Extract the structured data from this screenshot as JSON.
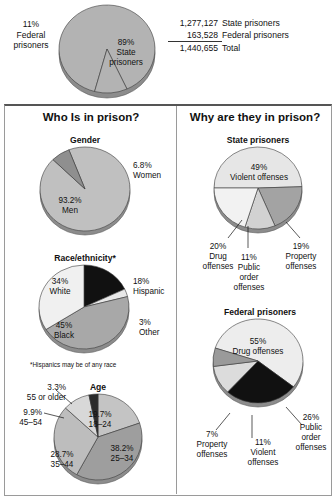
{
  "top": {
    "chart_title": "",
    "labels": {
      "federal": "11%\nFederal\nprisoners",
      "federal_pct": "11%",
      "federal_l1": "Federal",
      "federal_l2": "prisoners",
      "state_pct": "89%",
      "state_l1": "State",
      "state_l2": "prisoners"
    },
    "totals": [
      {
        "number": "1,277,127",
        "label": "State prisoners"
      },
      {
        "number": "163,528",
        "label": "Federal prisoners"
      },
      {
        "number": "1,440,655",
        "label": "Total"
      }
    ]
  },
  "panels": {
    "left_title": "Who Is in prison?",
    "right_title": "Why are they in prison?"
  },
  "footnote": "*Hispanics may be of any race",
  "chart_data": [
    {
      "id": "jurisdiction",
      "type": "pie",
      "title": "",
      "categories": [
        "State prisoners",
        "Federal prisoners"
      ],
      "values": [
        89,
        11
      ],
      "labels": [
        "89%\nState\nprisoners",
        "11%\nFederal\nprisoners"
      ],
      "colors": [
        "#b3b3b3",
        "#b3b3b3"
      ],
      "start_angle": 195,
      "total": 100
    },
    {
      "id": "gender",
      "type": "pie",
      "title": "Gender",
      "categories": [
        "Men",
        "Women"
      ],
      "values": [
        93.2,
        6.8
      ],
      "labels": [
        "93.2%\nMen",
        "6.8%\nWomen"
      ],
      "colors": [
        "#c0c0c0",
        "#8f8f8f"
      ],
      "start_angle": 339,
      "total": 100
    },
    {
      "id": "race",
      "type": "pie",
      "title": "Race/ethnicity*",
      "categories": [
        "Hispanic",
        "Other",
        "Black",
        "White"
      ],
      "values": [
        18,
        3,
        45,
        34
      ],
      "labels": [
        "18%\nHispanic",
        "3%\nOther",
        "45%\nBlack",
        "34%\nWhite"
      ],
      "colors": [
        "#111111",
        "#e8e8e8",
        "#a8a8a8",
        "#f0f0f0"
      ],
      "start_angle": 0,
      "total": 100
    },
    {
      "id": "age",
      "type": "pie",
      "title": "Age",
      "categories": [
        "18–24",
        "25–34",
        "35–44",
        "45–54",
        "55 or older"
      ],
      "values": [
        19.7,
        38.2,
        28.7,
        9.9,
        3.3
      ],
      "labels": [
        "19.7%\n18–24",
        "38.2%\n25–34",
        "28.7%\n35–44",
        "9.9%\n45–54",
        "3.3%\n55 or older"
      ],
      "colors": [
        "#c4c4c4",
        "#9e9e9e",
        "#bdbdbd",
        "#d8d8d8",
        "#2b2b2b"
      ],
      "start_angle": 0,
      "total": 100
    },
    {
      "id": "state_offenses",
      "type": "pie",
      "title": "State prisoners",
      "categories": [
        "Violent offenses",
        "Property offenses",
        "Public order offenses",
        "Drug offenses"
      ],
      "values": [
        49,
        19,
        11,
        20
      ],
      "labels": [
        "49%\nViolent offenses",
        "19%\nProperty\noffenses",
        "11%\nPublic\norder\noffenses",
        "20%\nDrug\noffenses"
      ],
      "colors": [
        "#e6e6e6",
        "#a3a3a3",
        "#d2d2d2",
        "#f2f2f2"
      ],
      "start_angle": 270,
      "total": 100
    },
    {
      "id": "federal_offenses",
      "type": "pie",
      "title": "Federal prisoners",
      "categories": [
        "Drug offenses",
        "Public order offenses",
        "Violent offenses",
        "Property offenses"
      ],
      "values": [
        55,
        26,
        11,
        7
      ],
      "labels": [
        "55%\nDrug offenses",
        "26%\nPublic\norder\noffenses",
        "11%\nViolent\noffenses",
        "7%\nProperty\noffenses"
      ],
      "colors": [
        "#ededed",
        "#111111",
        "#dcdcdc",
        "#9a9a9a"
      ],
      "start_angle": 288,
      "total": 100
    }
  ],
  "labels": {
    "gender": {
      "men_pct": "93.2%",
      "men_name": "Men",
      "women_pct": "6.8%",
      "women_name": "Women"
    },
    "race": {
      "white_pct": "34%",
      "white_name": "White",
      "hispanic_pct": "18%",
      "hispanic_name": "Hispanic",
      "other_pct": "3%",
      "other_name": "Other",
      "black_pct": "45%",
      "black_name": "Black"
    },
    "age": {
      "a1824_pct": "19.7%",
      "a1824_name": "18–24",
      "a2534_pct": "38.2%",
      "a2534_name": "25–34",
      "a3544_pct": "28.7%",
      "a3544_name": "35–44",
      "a4554_pct": "9.9%",
      "a4554_name": "45–54",
      "a55_pct": "3.3%",
      "a55_name": "55 or older"
    },
    "state": {
      "violent_pct": "49%",
      "violent_name": "Violent offenses",
      "property_pct": "19%",
      "property_l1": "Property",
      "property_l2": "offenses",
      "public_pct": "11%",
      "public_l1": "Public",
      "public_l2": "order",
      "public_l3": "offenses",
      "drug_pct": "20%",
      "drug_l1": "Drug",
      "drug_l2": "offenses"
    },
    "federal": {
      "drug_pct": "55%",
      "drug_name": "Drug offenses",
      "public_pct": "26%",
      "public_l1": "Public",
      "public_l2": "order",
      "public_l3": "offenses",
      "violent_pct": "11%",
      "violent_l1": "Violent",
      "violent_l2": "offenses",
      "property_pct": "7%",
      "property_l1": "Property",
      "property_l2": "offenses"
    }
  },
  "titles": {
    "gender": "Gender",
    "race": "Race/ethnicity*",
    "age": "Age",
    "state": "State prisoners",
    "federal": "Federal prisoners"
  }
}
